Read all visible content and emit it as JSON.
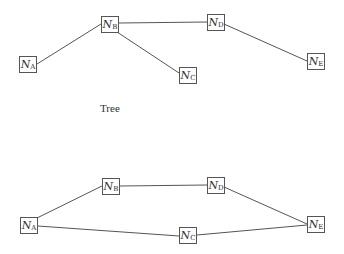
{
  "diagrams": [
    {
      "caption": "Tree",
      "nodes": [
        {
          "id": "A",
          "label": "N",
          "sub": "A",
          "x": 19,
          "y": 56
        },
        {
          "id": "B",
          "label": "N",
          "sub": "B",
          "x": 101,
          "y": 16
        },
        {
          "id": "C",
          "label": "N",
          "sub": "C",
          "x": 179,
          "y": 67
        },
        {
          "id": "D",
          "label": "N",
          "sub": "D",
          "x": 207,
          "y": 14
        },
        {
          "id": "E",
          "label": "N",
          "sub": "E",
          "x": 307,
          "y": 53
        }
      ],
      "edges": [
        [
          "A",
          "B"
        ],
        [
          "B",
          "D"
        ],
        [
          "B",
          "C"
        ],
        [
          "D",
          "E"
        ]
      ]
    },
    {
      "caption": "",
      "nodes": [
        {
          "id": "A",
          "label": "N",
          "sub": "A",
          "x": 20,
          "y": 217
        },
        {
          "id": "B",
          "label": "N",
          "sub": "B",
          "x": 102,
          "y": 178
        },
        {
          "id": "C",
          "label": "N",
          "sub": "C",
          "x": 179,
          "y": 227
        },
        {
          "id": "D",
          "label": "N",
          "sub": "D",
          "x": 207,
          "y": 177
        },
        {
          "id": "E",
          "label": "N",
          "sub": "E",
          "x": 307,
          "y": 216
        }
      ],
      "edges": [
        [
          "A",
          "B"
        ],
        [
          "B",
          "D"
        ],
        [
          "D",
          "E"
        ],
        [
          "A",
          "C"
        ],
        [
          "C",
          "E"
        ]
      ]
    }
  ],
  "colors": {
    "line": "#555555",
    "text": "#333333",
    "background": "#ffffff"
  }
}
